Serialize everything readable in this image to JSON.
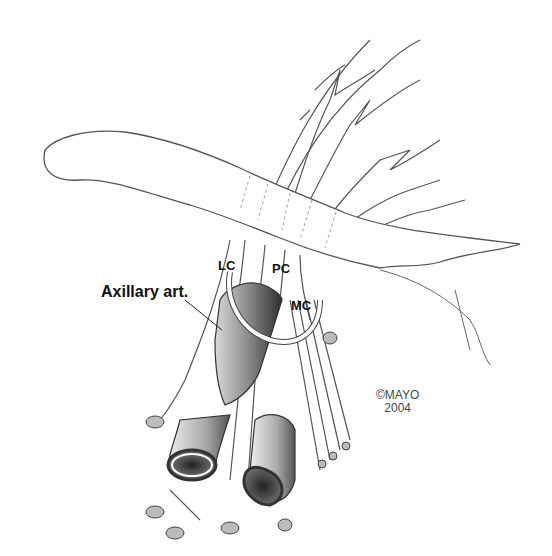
{
  "figure": {
    "labels": {
      "axillary_artery": "Axillary art.",
      "lateral_cord": "LC",
      "posterior_cord": "PC",
      "medial_cord": "MC"
    },
    "copyright": {
      "line1": "©MAYO",
      "line2": "2004"
    },
    "colors": {
      "line": "#444444",
      "vessel_dark": "#3a3a3a",
      "vessel_light": "#cfcfcf",
      "background": "#ffffff"
    }
  }
}
